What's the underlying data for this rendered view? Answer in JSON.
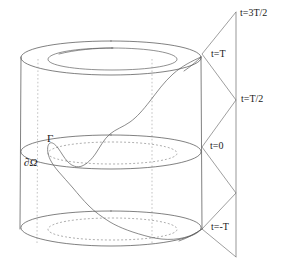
{
  "figure": {
    "background_color": "#ffffff",
    "line_color": "#4a4a4a",
    "dashed_color": "#7a7a7a",
    "text_color": "#1a1a1a"
  },
  "labels": {
    "t_3T_over_2": "t=3T/2",
    "t_T": "t=T",
    "t_T_over_2": "t=T/2",
    "t_0": "t=0",
    "t_minus_T": "t=-T",
    "gamma": "Γ",
    "boundary_omega": "∂Ω"
  },
  "time_levels": [
    {
      "key": "t_3T_over_2",
      "text": "t=3T/2",
      "x": 240,
      "y": 9
    },
    {
      "key": "t_T",
      "text": "t=T",
      "x": 211,
      "y": 50
    },
    {
      "key": "t_T_over_2",
      "text": "t=T/2",
      "x": 241,
      "y": 94
    },
    {
      "key": "t_0",
      "text": "t=0",
      "x": 210,
      "y": 141
    },
    {
      "key": "t_minus_T",
      "text": "t=-T",
      "x": 211,
      "y": 222
    }
  ],
  "geometry": {
    "cylinder": {
      "left_edge_x": 20,
      "right_edge_x": 202,
      "top_cap_center_y": 58,
      "mid_cap_center_y": 152,
      "bottom_cap_center_y": 228,
      "cap_half_height": 17,
      "hidden_generator_x": [
        37,
        152
      ]
    },
    "time_axis": {
      "vertical_line_x": 236,
      "top_y": 12,
      "bottom_y": 257
    },
    "zigzag": {
      "left_x": 202,
      "right_x": 236,
      "vertices_y": [
        12,
        54,
        100,
        147,
        193,
        235,
        257
      ]
    }
  },
  "annotations": {
    "gamma_position": {
      "x": 47,
      "y": 134
    },
    "boundary_position": {
      "x": 25,
      "y": 158
    }
  }
}
